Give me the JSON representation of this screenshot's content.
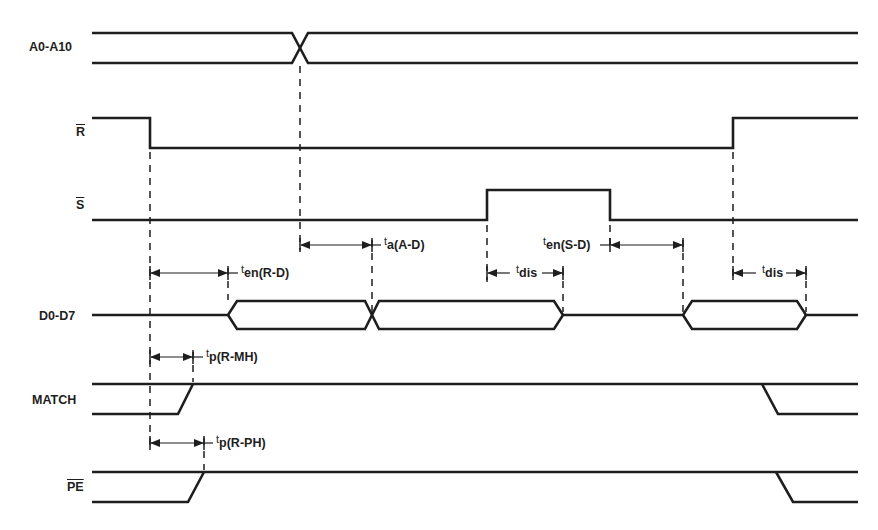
{
  "diagram": {
    "header_partial": "",
    "type": "timing-diagram",
    "signals": [
      {
        "id": "a0-a10",
        "label": "A0-A10",
        "overbar": false,
        "kind": "bus"
      },
      {
        "id": "r",
        "label": "R",
        "overbar": true,
        "kind": "digital"
      },
      {
        "id": "s",
        "label": "S",
        "overbar": true,
        "kind": "digital"
      },
      {
        "id": "d0-d7",
        "label": "D0-D7",
        "overbar": false,
        "kind": "tri-state bus"
      },
      {
        "id": "match",
        "label": "MATCH",
        "overbar": false,
        "kind": "digital"
      },
      {
        "id": "pe",
        "label": "PE",
        "overbar": true,
        "kind": "digital"
      }
    ],
    "timing_params": [
      {
        "id": "ta-ad",
        "t": "t",
        "sub": "a(A-D)",
        "from": "A0-A10 transition",
        "to": "D0-D7 valid"
      },
      {
        "id": "ten-sd",
        "t": "t",
        "sub": "en(S-D)",
        "from": "S rising back low",
        "to": "D0-D7 enabled"
      },
      {
        "id": "ten-rd",
        "t": "t",
        "sub": "en(R-D)",
        "from": "R falling",
        "to": "D0-D7 enabled"
      },
      {
        "id": "tdis-1",
        "t": "t",
        "sub": "dis",
        "from": "S rising",
        "to": "D0-D7 float"
      },
      {
        "id": "tdis-2",
        "t": "t",
        "sub": "dis",
        "from": "R rising",
        "to": "D0-D7 float"
      },
      {
        "id": "tp-rmh",
        "t": "t",
        "sub": "p(R-MH)",
        "from": "R falling",
        "to": "MATCH high"
      },
      {
        "id": "tp-rph",
        "t": "t",
        "sub": "p(R-PH)",
        "from": "R falling",
        "to": "PE high"
      }
    ],
    "colors": {
      "ink": "#1e1e1e",
      "background": "#ffffff"
    }
  }
}
